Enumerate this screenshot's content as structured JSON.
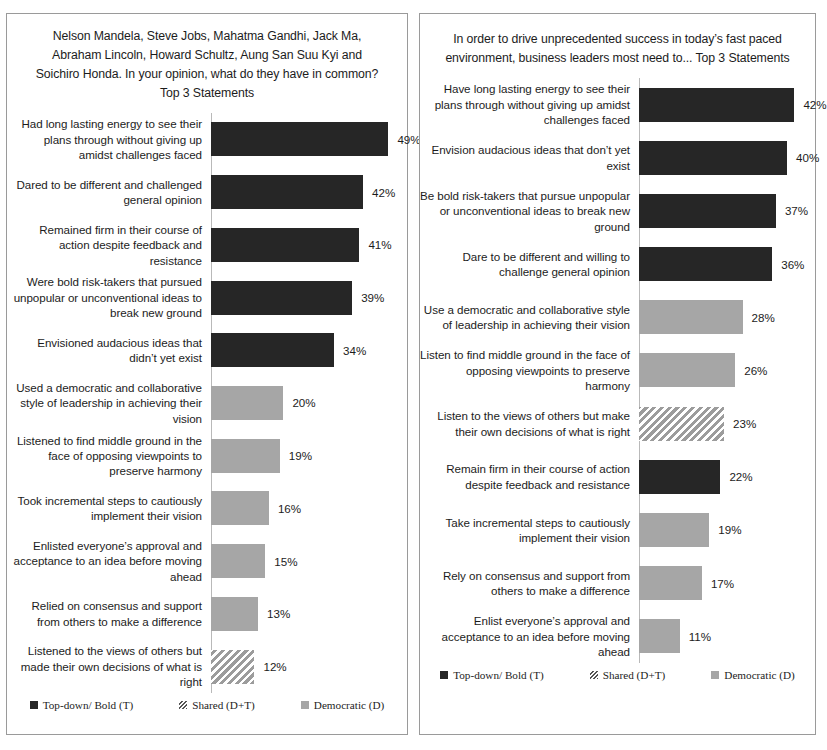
{
  "legend": {
    "items": [
      {
        "label": "Top-down/ Bold (T)",
        "key": "topdown"
      },
      {
        "label": "Shared (D+T)",
        "key": "shared"
      },
      {
        "label": "Democratic (D)",
        "key": "democratic"
      }
    ]
  },
  "colors": {
    "topdown": "#262626",
    "democratic": "#a6a6a6",
    "shared_stripe": "#9c9c9c",
    "axis": "#b9b9b9",
    "border": "#9a9a9a",
    "text": "#1c1c1c"
  },
  "chart_data": [
    {
      "type": "bar",
      "id": "left",
      "orientation": "horizontal",
      "title": "Nelson Mandela, Steve Jobs, Mahatma Gandhi, Jack Ma, Abraham Lincoln, Howard Schultz, Aung San Suu Kyi and Soichiro Honda. In your opinion, what do they have in common? Top 3 Statements",
      "xlabel": "",
      "ylabel": "",
      "xlim": [
        0,
        55
      ],
      "grid": false,
      "legend_position": "bottom",
      "categories": [
        "Had long lasting energy to see their plans through without giving up amidst challenges faced",
        "Dared to be different and challenged general opinion",
        "Remained firm in their course of action despite feedback and resistance",
        "Were bold risk-takers that pursued unpopular or unconventional ideas to break new ground",
        "Envisioned audacious  ideas that didn’t yet exist",
        "Used a democratic and collaborative style of leadership  in achieving their vision",
        "Listened to find middle ground in the face of opposing viewpoints  to preserve harmony",
        "Took incremental steps to cautiously implement their vision",
        "Enlisted everyone’s approval and acceptance to an idea before moving ahead",
        "Relied on consensus and support from others to make a difference",
        "Listened to the views of others but made their own decisions of what is right"
      ],
      "values": [
        49,
        42,
        41,
        39,
        34,
        20,
        19,
        16,
        15,
        13,
        12
      ],
      "value_labels": [
        "49%",
        "42%",
        "41%",
        "39%",
        "34%",
        "20%",
        "19%",
        "16%",
        "15%",
        "13%",
        "12%"
      ],
      "series_keys": [
        "topdown",
        "topdown",
        "topdown",
        "topdown",
        "topdown",
        "democratic",
        "democratic",
        "democratic",
        "democratic",
        "democratic",
        "shared"
      ]
    },
    {
      "type": "bar",
      "id": "right",
      "orientation": "horizontal",
      "title": "In order to drive unprecedented success in today’s fast paced environment, business leaders most need to...\nTop 3 Statements",
      "xlabel": "",
      "ylabel": "",
      "xlim": [
        0,
        48
      ],
      "grid": false,
      "legend_position": "bottom",
      "categories": [
        "Have long lasting energy to see their plans through without giving up amidst challenges faced",
        "Envision audacious ideas that don’t yet exist",
        "Be bold risk-takers  that pursue unpopular or unconventional ideas to break new ground",
        "Dare to be different and willing to challenge  general opinion",
        "Use a democratic and collaborative style of leadership  in achieving their vision",
        "Listen to find middle ground in the face of opposing viewpoints  to preserve harmony",
        "Listen to the views of others but make their own decisions of what is right",
        "Remain firm in their course of action despite feedback and resistance",
        "Take incremental steps to cautiously implement their vision",
        "Rely on consensus and support from others to make a difference",
        "Enlist everyone’s approval and acceptance to an idea before moving ahead"
      ],
      "values": [
        42,
        40,
        37,
        36,
        28,
        26,
        23,
        22,
        19,
        17,
        11
      ],
      "value_labels": [
        "42%",
        "40%",
        "37%",
        "36%",
        "28%",
        "26%",
        "23%",
        "22%",
        "19%",
        "17%",
        "11%"
      ],
      "series_keys": [
        "topdown",
        "topdown",
        "topdown",
        "topdown",
        "democratic",
        "democratic",
        "shared",
        "topdown",
        "democratic",
        "democratic",
        "democratic"
      ]
    }
  ]
}
